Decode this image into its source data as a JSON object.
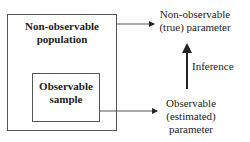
{
  "diagram": {
    "population_box": {
      "line1": "Non-observable",
      "line2": "population"
    },
    "sample_box": {
      "line1": "Observable",
      "line2": "sample"
    },
    "true_parameter": {
      "line1": "Non-observable",
      "line2": "(true) parameter"
    },
    "estimated_parameter": {
      "line1": "Observable",
      "line2": "(estimated)",
      "line3": "parameter"
    },
    "inference_label": "Inference"
  }
}
